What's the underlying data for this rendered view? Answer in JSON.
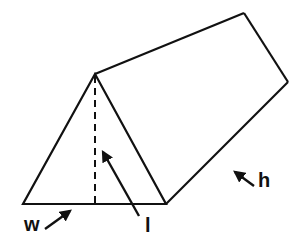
{
  "diagram": {
    "colors": {
      "stroke": "#111111",
      "background": "#ffffff"
    },
    "labels": {
      "w": "w",
      "l": "l",
      "h": "h"
    },
    "vertices": {
      "apex_front": [
        95,
        74
      ],
      "base_left": [
        23,
        204
      ],
      "base_right": [
        166,
        204
      ],
      "apex_back": [
        244,
        13
      ],
      "base_right_back": [
        288,
        82
      ]
    }
  }
}
